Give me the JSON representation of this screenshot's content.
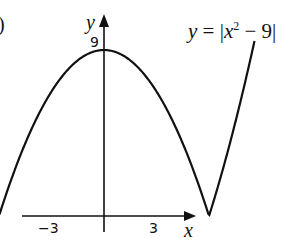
{
  "part_marker": ")",
  "chart_data": {
    "type": "line",
    "title": "",
    "function_label": "y = |x² − 9|",
    "xlabel": "x",
    "ylabel": "y",
    "x_ticks": [
      "-3",
      "3"
    ],
    "y_ticks": [
      "9"
    ],
    "key_points": [
      {
        "x": -3,
        "y": 0
      },
      {
        "x": 0,
        "y": 9
      },
      {
        "x": 3,
        "y": 0
      }
    ],
    "xlim": [
      -4.3,
      5.8
    ],
    "ylim": [
      0,
      11
    ],
    "grid": false,
    "series": [
      {
        "name": "y = |x^2 - 9|",
        "x": [
          -4.3,
          -4,
          -3.5,
          -3,
          -2.5,
          -2,
          -1.5,
          -1,
          -0.5,
          0,
          0.5,
          1,
          1.5,
          2,
          2.5,
          3,
          3.5,
          4,
          4.3
        ],
        "values": [
          9.49,
          7,
          3.25,
          0,
          2.75,
          5,
          6.75,
          8,
          8.75,
          9,
          8.75,
          8,
          6.75,
          5,
          2.75,
          0,
          3.25,
          7,
          9.49
        ]
      }
    ]
  },
  "labels": {
    "y_axis": "y",
    "x_axis": "x",
    "tick_neg3": "−3",
    "tick_3": "3",
    "tick_9": "9",
    "eq_y": "y",
    "eq_rest": " = |",
    "eq_x": "x",
    "eq_sup": "2",
    "eq_tail": " − 9|"
  }
}
